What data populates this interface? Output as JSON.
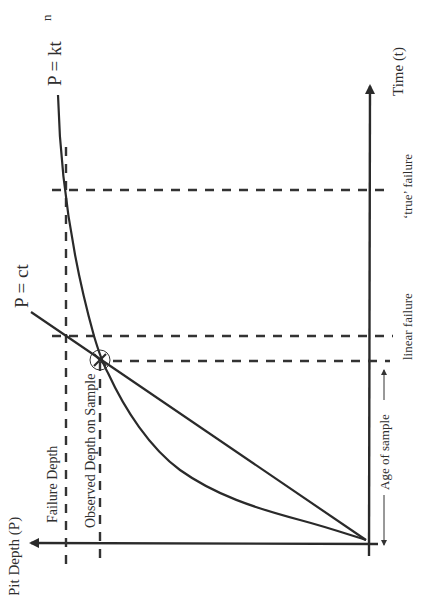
{
  "diagram": {
    "orientation": "rotated 90° counter-clockwise",
    "labels": {
      "x_axis": "Time (t)",
      "y_axis": "Pit Depth (P)",
      "power_curve": "P = kt",
      "power_exponent": "n",
      "linear_curve": "P = ct",
      "failure_depth": "Failure Depth",
      "observed_depth": "Observed Depth on Sample",
      "true_failure": "‘true’ failure",
      "linear_failure": "linear failure",
      "age_of_sample": "Age of sample"
    },
    "colors": {
      "line": "#2a2a2a",
      "text": "#2e2e2e",
      "background": "#ffffff"
    }
  }
}
